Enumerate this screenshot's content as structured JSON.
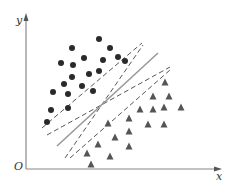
{
  "diagram": {
    "title": "",
    "axes": {
      "origin_label": "O",
      "x_label": "x",
      "y_label": "y",
      "origin": [
        26,
        169
      ],
      "x_end": [
        222,
        169
      ],
      "y_end": [
        26,
        13
      ],
      "color": "#888888"
    },
    "class_circles": {
      "color": "#2a2a2a",
      "radius": 3,
      "points": [
        [
          99,
          39
        ],
        [
          72,
          48
        ],
        [
          110,
          48
        ],
        [
          61,
          63
        ],
        [
          73,
          65
        ],
        [
          84,
          58
        ],
        [
          103,
          60
        ],
        [
          118,
          57
        ],
        [
          125,
          61
        ],
        [
          72,
          77
        ],
        [
          89,
          74
        ],
        [
          99,
          71
        ],
        [
          64,
          84
        ],
        [
          82,
          86
        ],
        [
          93,
          91
        ],
        [
          53,
          92
        ],
        [
          68,
          94
        ],
        [
          51,
          110
        ],
        [
          68,
          108
        ],
        [
          47,
          122
        ]
      ]
    },
    "class_triangles": {
      "color": "#555555",
      "size": 7,
      "points": [
        [
          165,
          82
        ],
        [
          153,
          96
        ],
        [
          169,
          96
        ],
        [
          140,
          109
        ],
        [
          153,
          109
        ],
        [
          164,
          107
        ],
        [
          181,
          107
        ],
        [
          129,
          118
        ],
        [
          108,
          123
        ],
        [
          148,
          124
        ],
        [
          164,
          124
        ],
        [
          129,
          131
        ],
        [
          115,
          137
        ],
        [
          129,
          146
        ],
        [
          98,
          144
        ],
        [
          87,
          153
        ],
        [
          110,
          156
        ],
        [
          91,
          164
        ]
      ]
    },
    "separating_lines": {
      "solid": {
        "from": [
          57,
          146
        ],
        "to": [
          158,
          53
        ],
        "color": "#999999"
      },
      "dashed": [
        {
          "from": [
            42,
            128
          ],
          "to": [
            142,
            43
          ]
        },
        {
          "from": [
            47,
            135
          ],
          "to": [
            170,
            67
          ]
        },
        {
          "from": [
            65,
            158
          ],
          "to": [
            143,
            45
          ]
        },
        {
          "from": [
            70,
            158
          ],
          "to": [
            170,
            70
          ]
        }
      ],
      "dashed_color": "#444444"
    }
  }
}
